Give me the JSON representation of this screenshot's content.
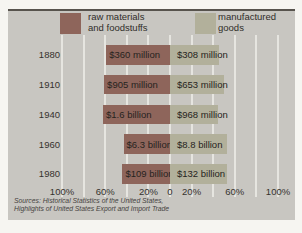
{
  "figure": {
    "legend": {
      "raw_line1": "raw materials",
      "raw_line2": "and foodstuffs",
      "mfg_line1": "manufactured",
      "mfg_line2": "goods"
    },
    "sources_line1": "Sources: Historical Statistics of the United States,",
    "sources_line2": "Highlights of United States Export and Import Trade"
  },
  "chart_data": {
    "type": "bar",
    "orientation": "horizontal-diverging",
    "title": "",
    "categories": [
      "1880",
      "1910",
      "1940",
      "1960",
      "1980"
    ],
    "series": [
      {
        "name": "raw materials and foodstuffs",
        "side": "left",
        "color": "#8e655b",
        "pct_of_trade": [
          59,
          61,
          62,
          43,
          44
        ],
        "value_labels": [
          "$360 million",
          "$905 million",
          "$1.6 billion",
          "$6.3 billion",
          "$109 billion"
        ]
      },
      {
        "name": "manufactured goods",
        "side": "right",
        "color": "#b2b09b",
        "pct_of_trade": [
          45,
          50,
          44,
          53,
          53
        ],
        "value_labels": [
          "$308 million",
          "$653 million",
          "$968 million",
          "$8.8 billion",
          "$132 billion"
        ]
      }
    ],
    "x_axis": {
      "unit": "percent",
      "ticks": [
        -100,
        -60,
        -20,
        0,
        20,
        60,
        100
      ],
      "tick_labels": [
        "100%",
        "60%",
        "20%",
        "0",
        "20%",
        "60%",
        "100%"
      ],
      "range": [
        -100,
        100
      ]
    },
    "grid": true,
    "grid_ticks": [
      -100,
      -80,
      -60,
      -40,
      -20,
      0,
      20,
      40,
      60,
      80,
      100
    ],
    "legend_position": "top"
  }
}
